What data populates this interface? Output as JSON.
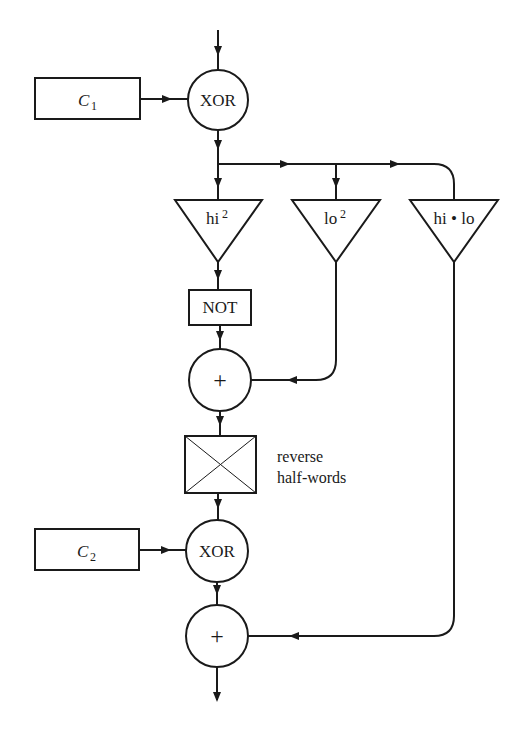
{
  "diagram": {
    "type": "flowchart",
    "colors": {
      "stroke": "#1a1a1a",
      "background": "#ffffff"
    },
    "nodes": {
      "c1": {
        "label": "C",
        "subscript": "1",
        "shape": "rectangle"
      },
      "xor1": {
        "label": "XOR",
        "shape": "circle"
      },
      "hi_sq": {
        "label": "hi",
        "superscript": "2",
        "shape": "triangle"
      },
      "lo_sq": {
        "label": "lo",
        "superscript": "2",
        "shape": "triangle"
      },
      "hi_lo": {
        "label": "hi • lo",
        "shape": "triangle"
      },
      "not": {
        "label": "NOT",
        "shape": "rectangle"
      },
      "add1": {
        "label": "+",
        "shape": "circle"
      },
      "swap": {
        "label": "",
        "shape": "crossed-box"
      },
      "swap_note_1": {
        "label": "reverse"
      },
      "swap_note_2": {
        "label": "half-words"
      },
      "c2": {
        "label": "C",
        "subscript": "2",
        "shape": "rectangle"
      },
      "xor2": {
        "label": "XOR",
        "shape": "circle"
      },
      "add2": {
        "label": "+",
        "shape": "circle"
      }
    },
    "edges": [
      {
        "from": "input",
        "to": "xor1"
      },
      {
        "from": "c1",
        "to": "xor1"
      },
      {
        "from": "xor1",
        "to": "hi_sq"
      },
      {
        "from": "xor1",
        "to": "lo_sq"
      },
      {
        "from": "xor1",
        "to": "hi_lo"
      },
      {
        "from": "hi_sq",
        "to": "not"
      },
      {
        "from": "not",
        "to": "add1"
      },
      {
        "from": "lo_sq",
        "to": "add1"
      },
      {
        "from": "add1",
        "to": "swap"
      },
      {
        "from": "swap",
        "to": "xor2"
      },
      {
        "from": "c2",
        "to": "xor2"
      },
      {
        "from": "xor2",
        "to": "add2"
      },
      {
        "from": "hi_lo",
        "to": "add2"
      },
      {
        "from": "add2",
        "to": "output"
      }
    ]
  }
}
